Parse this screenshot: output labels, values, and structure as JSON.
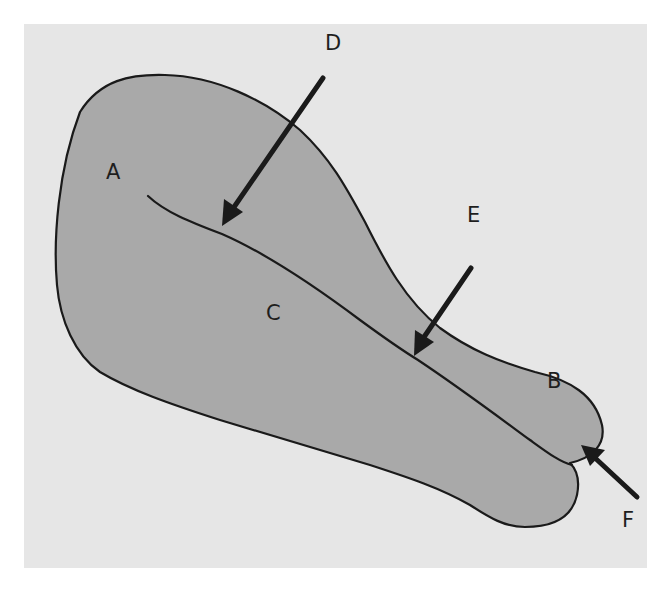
{
  "diagram": {
    "colors": {
      "background": "#e6e6e6",
      "fill": "#a9a9a9",
      "outline": "#1a1a1a",
      "text": "#1e1e1e"
    },
    "labels": {
      "A": "A",
      "B": "B",
      "C": "C",
      "D": "D",
      "E": "E",
      "F": "F"
    },
    "regions": [
      {
        "id": "A",
        "label": "A",
        "location": "broad upper-left lobe"
      },
      {
        "id": "B",
        "label": "B",
        "location": "upper narrow tip at right"
      },
      {
        "id": "C",
        "label": "C",
        "location": "lower elongated lobe below dividing line"
      }
    ],
    "arrows": [
      {
        "id": "D",
        "label": "D",
        "points_to": "dividing line near upper-left"
      },
      {
        "id": "E",
        "label": "E",
        "points_to": "dividing line in middle section"
      },
      {
        "id": "F",
        "label": "F",
        "points_to": "notch where the two tips meet"
      }
    ]
  }
}
